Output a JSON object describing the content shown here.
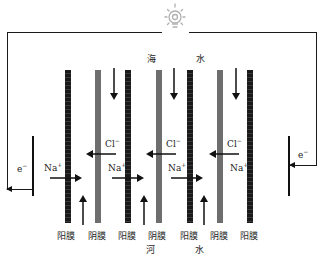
{
  "diagram": {
    "top_labels": {
      "left": "海",
      "right": "水"
    },
    "bottom_labels": {
      "left": "河",
      "right": "水"
    },
    "membranes": [
      {
        "type": "cation",
        "label": "阳膜"
      },
      {
        "type": "anion",
        "label": "阴膜"
      },
      {
        "type": "cation",
        "label": "阳膜"
      },
      {
        "type": "anion",
        "label": "阴膜"
      },
      {
        "type": "cation",
        "label": "阳膜"
      },
      {
        "type": "anion",
        "label": "阴膜"
      },
      {
        "type": "cation",
        "label": "阳膜"
      }
    ],
    "ions": {
      "cl": "Cl",
      "cl_charge": "−",
      "na": "Na",
      "na_charge": "+"
    },
    "electrons": {
      "left": "e",
      "right": "e",
      "charge": "−"
    },
    "load_icon": "light-bulb-icon",
    "colors": {
      "cation_membrane": "#1a1a1a",
      "anion_membrane": "#6e6e6e",
      "wire": "#1a1a1a",
      "bulb": "#b0b0b0"
    }
  }
}
